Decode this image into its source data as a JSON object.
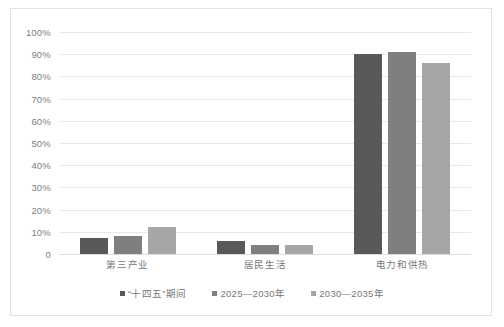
{
  "chart_data": {
    "type": "bar",
    "title": "",
    "subtitle": "",
    "xlabel": "",
    "ylabel": "",
    "ylim": [
      0,
      100
    ],
    "grid": true,
    "legend_position": "bottom",
    "categories": [
      "第三产业",
      "居民生活",
      "电力和供热"
    ],
    "y_ticks": [
      {
        "value": 100,
        "label": "100%"
      },
      {
        "value": 90,
        "label": "90%"
      },
      {
        "value": 80,
        "label": "80%"
      },
      {
        "value": 70,
        "label": "70%"
      },
      {
        "value": 60,
        "label": "60%"
      },
      {
        "value": 50,
        "label": "50%"
      },
      {
        "value": 40,
        "label": "40%"
      },
      {
        "value": 30,
        "label": "30%"
      },
      {
        "value": 20,
        "label": "20%"
      },
      {
        "value": 10,
        "label": "10%"
      },
      {
        "value": 0,
        "label": "0"
      }
    ],
    "series": [
      {
        "name": "“十四五”期间",
        "color": "#595959",
        "values": [
          7,
          6,
          90
        ]
      },
      {
        "name": "2025—2030年",
        "color": "#7f7f7f",
        "values": [
          8,
          4,
          91
        ]
      },
      {
        "name": "2030—2035年",
        "color": "#a6a6a6",
        "values": [
          12,
          4,
          86
        ]
      }
    ]
  },
  "colors": {
    "background": "#ffffff",
    "frame_border": "#e2e2e2",
    "gridline": "#e8e8e8",
    "axis_text": "#808080",
    "category_text": "#777777",
    "series_1": "#595959",
    "series_2": "#7f7f7f",
    "series_3": "#a6a6a6"
  }
}
